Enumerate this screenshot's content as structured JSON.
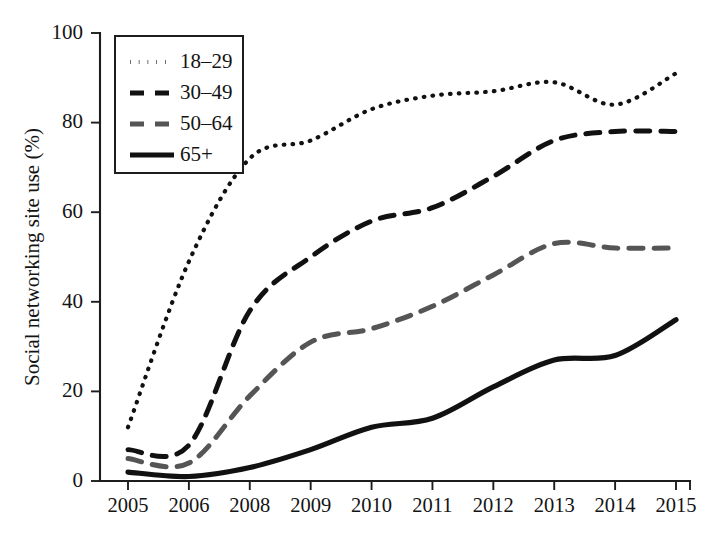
{
  "chart_data": {
    "type": "line",
    "title": "",
    "xlabel": "",
    "ylabel": "Social networking site use (%)",
    "ylim": [
      0,
      100
    ],
    "yticks": [
      0,
      20,
      40,
      60,
      80,
      100
    ],
    "ytick_labels": [
      "0",
      "20",
      "40",
      "60",
      "80",
      "100"
    ],
    "grid": false,
    "legend_position": "top-left",
    "categories": [
      "2005",
      "2006",
      "2008",
      "2009",
      "2010",
      "2011",
      "2012",
      "2013",
      "2014",
      "2015"
    ],
    "x": [
      2005,
      2006,
      2008,
      2009,
      2010,
      2011,
      2012,
      2013,
      2014,
      2015
    ],
    "series": [
      {
        "name": "18–29",
        "style": "dotted",
        "color": "#111111",
        "values": [
          12,
          49,
          72,
          76,
          83,
          86,
          87,
          89,
          84,
          91
        ]
      },
      {
        "name": "30–49",
        "style": "dashed",
        "color": "#111111",
        "values": [
          7,
          8,
          38,
          50,
          58,
          61,
          68,
          76,
          78,
          78
        ]
      },
      {
        "name": "50–64",
        "style": "dashed",
        "color": "#555555",
        "values": [
          5,
          4,
          19,
          31,
          34,
          39,
          46,
          53,
          52,
          52
        ]
      },
      {
        "name": "65+",
        "style": "solid",
        "color": "#111111",
        "values": [
          2,
          1,
          3,
          7,
          12,
          14,
          21,
          27,
          28,
          36
        ]
      }
    ]
  },
  "legend": {
    "entries": [
      {
        "label": "18–29"
      },
      {
        "label": "30–49"
      },
      {
        "label": "50–64"
      },
      {
        "label": "65+"
      }
    ]
  },
  "axes": {
    "y_title": "Social networking site use (%)"
  }
}
